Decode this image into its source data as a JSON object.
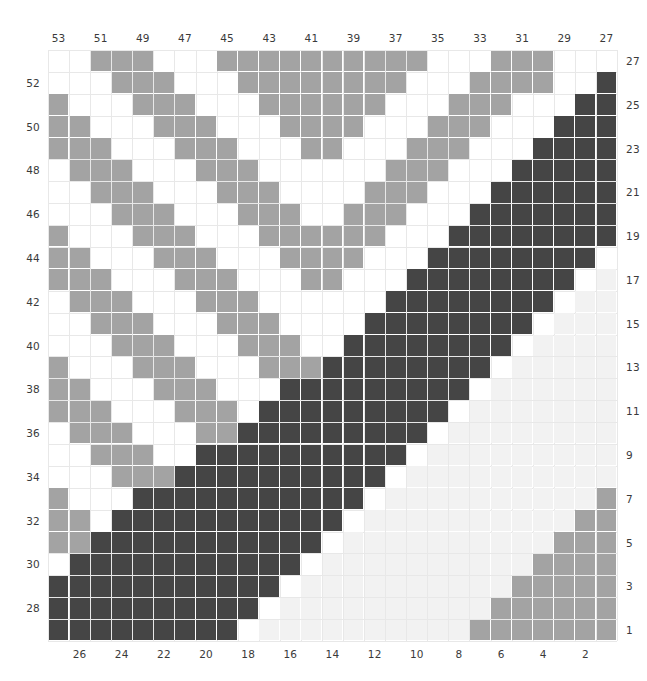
{
  "chart_data": {
    "type": "heatmap",
    "title": "",
    "xlabel": "",
    "ylabel": "",
    "grid": true,
    "legend": null,
    "n_rows": 27,
    "n_cols": 27,
    "colors": {
      "white": "#ffffff",
      "very_light": "#f2f2f2",
      "medium_gray": "#a3a3a3",
      "dark_gray": "#454545",
      "gridline": "#e8e8e8",
      "text": "#3a3a3a"
    },
    "value_levels": [
      0,
      1,
      2,
      3
    ],
    "value_colors": [
      "#ffffff",
      "#f2f2f2",
      "#a3a3a3",
      "#454545"
    ],
    "axes": {
      "top": {
        "labels": [
          "53",
          "51",
          "49",
          "47",
          "45",
          "43",
          "41",
          "39",
          "37",
          "35",
          "33",
          "31",
          "29",
          "27"
        ],
        "positions": [
          0,
          2,
          4,
          6,
          8,
          10,
          12,
          14,
          16,
          18,
          20,
          22,
          24,
          26
        ]
      },
      "bottom": {
        "labels": [
          "26",
          "24",
          "22",
          "20",
          "18",
          "16",
          "14",
          "12",
          "10",
          "8",
          "6",
          "4",
          "2"
        ],
        "positions": [
          1,
          3,
          5,
          7,
          9,
          11,
          13,
          15,
          17,
          19,
          21,
          23,
          25
        ]
      },
      "left": {
        "labels": [
          "52",
          "50",
          "48",
          "46",
          "44",
          "42",
          "40",
          "38",
          "36",
          "34",
          "32",
          "30",
          "28"
        ],
        "positions": [
          1,
          3,
          5,
          7,
          9,
          11,
          13,
          15,
          17,
          19,
          21,
          23,
          25
        ]
      },
      "right": {
        "labels": [
          "27",
          "25",
          "23",
          "21",
          "19",
          "17",
          "15",
          "13",
          "11",
          "9",
          "7",
          "5",
          "3",
          "1"
        ],
        "positions": [
          0,
          2,
          4,
          6,
          8,
          10,
          12,
          14,
          16,
          18,
          20,
          22,
          24,
          26
        ]
      }
    },
    "matrix": [
      [
        0,
        0,
        2,
        2,
        2,
        0,
        0,
        0,
        2,
        2,
        2,
        2,
        2,
        2,
        2,
        2,
        2,
        2,
        0,
        0,
        0,
        2,
        2,
        2,
        0,
        0,
        0
      ],
      [
        0,
        0,
        0,
        2,
        2,
        2,
        0,
        0,
        0,
        2,
        2,
        2,
        2,
        2,
        2,
        2,
        2,
        0,
        0,
        0,
        2,
        2,
        2,
        2,
        0,
        0,
        3
      ],
      [
        2,
        0,
        0,
        0,
        2,
        2,
        2,
        0,
        0,
        0,
        2,
        2,
        2,
        2,
        2,
        2,
        0,
        0,
        0,
        2,
        2,
        2,
        0,
        0,
        0,
        3,
        3
      ],
      [
        2,
        2,
        0,
        0,
        0,
        2,
        2,
        2,
        0,
        0,
        0,
        2,
        2,
        2,
        2,
        0,
        0,
        0,
        2,
        2,
        2,
        0,
        0,
        0,
        3,
        3,
        3
      ],
      [
        2,
        2,
        2,
        0,
        0,
        0,
        2,
        2,
        2,
        0,
        0,
        0,
        2,
        2,
        0,
        0,
        0,
        2,
        2,
        2,
        0,
        0,
        0,
        3,
        3,
        3,
        3
      ],
      [
        0,
        2,
        2,
        2,
        0,
        0,
        0,
        2,
        2,
        2,
        0,
        0,
        0,
        0,
        0,
        0,
        2,
        2,
        2,
        0,
        0,
        0,
        3,
        3,
        3,
        3,
        3
      ],
      [
        0,
        0,
        2,
        2,
        2,
        0,
        0,
        0,
        2,
        2,
        2,
        0,
        0,
        0,
        0,
        2,
        2,
        2,
        0,
        0,
        0,
        3,
        3,
        3,
        3,
        3,
        3
      ],
      [
        0,
        0,
        0,
        2,
        2,
        2,
        0,
        0,
        0,
        2,
        2,
        2,
        0,
        0,
        2,
        2,
        2,
        0,
        0,
        0,
        3,
        3,
        3,
        3,
        3,
        3,
        3
      ],
      [
        2,
        0,
        0,
        0,
        2,
        2,
        2,
        0,
        0,
        0,
        2,
        2,
        2,
        2,
        2,
        2,
        0,
        0,
        0,
        3,
        3,
        3,
        3,
        3,
        3,
        3,
        3
      ],
      [
        2,
        2,
        0,
        0,
        0,
        2,
        2,
        2,
        0,
        0,
        0,
        2,
        2,
        2,
        2,
        0,
        0,
        0,
        3,
        3,
        3,
        3,
        3,
        3,
        3,
        3,
        0
      ],
      [
        2,
        2,
        2,
        0,
        0,
        0,
        2,
        2,
        2,
        0,
        0,
        0,
        2,
        2,
        0,
        0,
        0,
        3,
        3,
        3,
        3,
        3,
        3,
        3,
        3,
        0,
        1
      ],
      [
        0,
        2,
        2,
        2,
        0,
        0,
        0,
        2,
        2,
        2,
        0,
        0,
        0,
        0,
        0,
        0,
        3,
        3,
        3,
        3,
        3,
        3,
        3,
        3,
        0,
        1,
        1
      ],
      [
        0,
        0,
        2,
        2,
        2,
        0,
        0,
        0,
        2,
        2,
        2,
        0,
        0,
        0,
        0,
        3,
        3,
        3,
        3,
        3,
        3,
        3,
        3,
        0,
        1,
        1,
        1
      ],
      [
        0,
        0,
        0,
        2,
        2,
        2,
        0,
        0,
        0,
        2,
        2,
        2,
        0,
        0,
        3,
        3,
        3,
        3,
        3,
        3,
        3,
        3,
        0,
        1,
        1,
        1,
        1
      ],
      [
        2,
        0,
        0,
        0,
        2,
        2,
        2,
        0,
        0,
        0,
        2,
        2,
        2,
        3,
        3,
        3,
        3,
        3,
        3,
        3,
        3,
        0,
        1,
        1,
        1,
        1,
        1
      ],
      [
        2,
        2,
        0,
        0,
        0,
        2,
        2,
        2,
        0,
        0,
        0,
        3,
        3,
        3,
        3,
        3,
        3,
        3,
        3,
        3,
        0,
        1,
        1,
        1,
        1,
        1,
        1
      ],
      [
        2,
        2,
        2,
        0,
        0,
        0,
        2,
        2,
        2,
        0,
        3,
        3,
        3,
        3,
        3,
        3,
        3,
        3,
        3,
        0,
        1,
        1,
        1,
        1,
        1,
        1,
        1
      ],
      [
        0,
        2,
        2,
        2,
        0,
        0,
        0,
        2,
        2,
        3,
        3,
        3,
        3,
        3,
        3,
        3,
        3,
        3,
        0,
        1,
        1,
        1,
        1,
        1,
        1,
        1,
        1
      ],
      [
        0,
        0,
        2,
        2,
        2,
        0,
        0,
        3,
        3,
        3,
        3,
        3,
        3,
        3,
        3,
        3,
        3,
        0,
        1,
        1,
        1,
        1,
        1,
        1,
        1,
        1,
        1
      ],
      [
        0,
        0,
        0,
        2,
        2,
        2,
        3,
        3,
        3,
        3,
        3,
        3,
        3,
        3,
        3,
        3,
        0,
        1,
        1,
        1,
        1,
        1,
        1,
        1,
        1,
        1,
        1
      ],
      [
        2,
        0,
        0,
        0,
        3,
        3,
        3,
        3,
        3,
        3,
        3,
        3,
        3,
        3,
        3,
        0,
        1,
        1,
        1,
        1,
        1,
        1,
        1,
        1,
        1,
        1,
        2
      ],
      [
        2,
        2,
        0,
        3,
        3,
        3,
        3,
        3,
        3,
        3,
        3,
        3,
        3,
        3,
        0,
        1,
        1,
        1,
        1,
        1,
        1,
        1,
        1,
        1,
        1,
        2,
        2
      ],
      [
        2,
        2,
        3,
        3,
        3,
        3,
        3,
        3,
        3,
        3,
        3,
        3,
        3,
        0,
        1,
        1,
        1,
        1,
        1,
        1,
        1,
        1,
        1,
        1,
        2,
        2,
        2
      ],
      [
        0,
        3,
        3,
        3,
        3,
        3,
        3,
        3,
        3,
        3,
        3,
        3,
        0,
        1,
        1,
        1,
        1,
        1,
        1,
        1,
        1,
        1,
        1,
        2,
        2,
        2,
        2
      ],
      [
        3,
        3,
        3,
        3,
        3,
        3,
        3,
        3,
        3,
        3,
        3,
        0,
        1,
        1,
        1,
        1,
        1,
        1,
        1,
        1,
        1,
        1,
        2,
        2,
        2,
        2,
        2
      ],
      [
        3,
        3,
        3,
        3,
        3,
        3,
        3,
        3,
        3,
        3,
        0,
        1,
        1,
        1,
        1,
        1,
        1,
        1,
        1,
        1,
        1,
        2,
        2,
        2,
        2,
        2,
        2
      ],
      [
        3,
        3,
        3,
        3,
        3,
        3,
        3,
        3,
        3,
        0,
        1,
        1,
        1,
        1,
        1,
        1,
        1,
        1,
        1,
        1,
        2,
        2,
        2,
        2,
        2,
        2,
        2
      ]
    ]
  }
}
